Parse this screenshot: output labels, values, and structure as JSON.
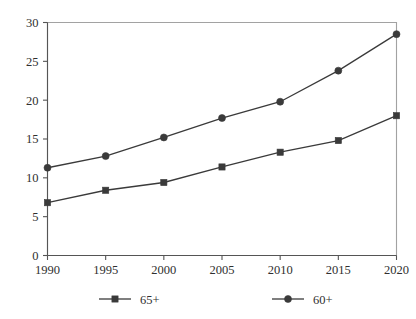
{
  "chart_data": {
    "type": "line",
    "title": "",
    "subtitle": "",
    "xlabel": "",
    "ylabel": "",
    "categories": [
      "1990",
      "1995",
      "2000",
      "2005",
      "2010",
      "2015",
      "2020"
    ],
    "x": [
      1990,
      1995,
      2000,
      2005,
      2010,
      2015,
      2020
    ],
    "series": [
      {
        "name": "65+",
        "marker": "square",
        "color": "#3a3a3a",
        "values": [
          6.8,
          8.4,
          9.4,
          11.4,
          13.3,
          14.8,
          18.0
        ]
      },
      {
        "name": "60+",
        "marker": "circle",
        "color": "#3a3a3a",
        "values": [
          11.3,
          12.8,
          15.2,
          17.7,
          19.8,
          23.8,
          28.5
        ]
      }
    ],
    "xlim": [
      1990,
      2020
    ],
    "ylim": [
      0,
      30
    ],
    "yticks": [
      0,
      5,
      10,
      15,
      20,
      25,
      30
    ],
    "ytick_labels": [
      "0",
      "5",
      "10",
      "15",
      "20",
      "25",
      "30"
    ],
    "xtick_labels": [
      "1990",
      "1995",
      "2000",
      "2005",
      "2010",
      "2015",
      "2020"
    ],
    "grid": false,
    "legend_position": "bottom",
    "legend_entries": [
      {
        "label": "65+",
        "marker": "square"
      },
      {
        "label": "60+",
        "marker": "circle"
      }
    ]
  },
  "axes": {
    "y_ticks": [
      {
        "label": "30",
        "value": 30
      },
      {
        "label": "25",
        "value": 25
      },
      {
        "label": "20",
        "value": 20
      },
      {
        "label": "15",
        "value": 15
      },
      {
        "label": "10",
        "value": 10
      },
      {
        "label": "5",
        "value": 5
      },
      {
        "label": "0",
        "value": 0
      }
    ],
    "x_ticks": [
      {
        "label": "1990",
        "value": 1990
      },
      {
        "label": "1995",
        "value": 1995
      },
      {
        "label": "2000",
        "value": 2000
      },
      {
        "label": "2005",
        "value": 2005
      },
      {
        "label": "2010",
        "value": 2010
      },
      {
        "label": "2015",
        "value": 2015
      },
      {
        "label": "2020",
        "value": 2020
      }
    ]
  },
  "legend": {
    "items": [
      {
        "label": "65+"
      },
      {
        "label": "60+"
      }
    ]
  },
  "colors": {
    "line": "#3a3a3a",
    "axis": "#555555",
    "text": "#2f2f2f",
    "background": "#ffffff"
  }
}
